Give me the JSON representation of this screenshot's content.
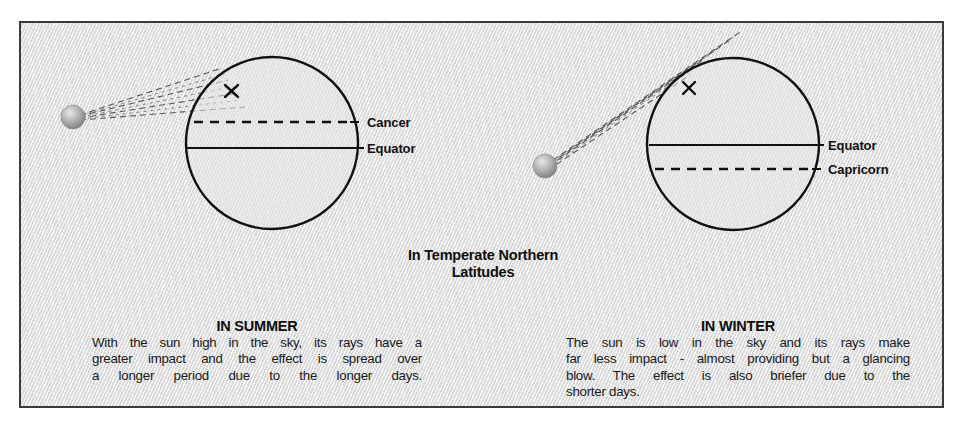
{
  "figure": {
    "background_color": "#ffffff",
    "panel_color": "#ececec",
    "border_color": "#3a3a3a",
    "ink_color": "#111111",
    "sun_color": "#9a9a9a"
  },
  "center_heading": {
    "line1": "In Temperate Northern",
    "line2": "Latitudes"
  },
  "summer": {
    "title": "IN SUMMER",
    "body": "With the sun high in the sky, its rays have a greater impact and the effect is spread over a longer period due to the longer days.",
    "lines": [
      "With the sun high in the sky, its rays have a",
      "greater impact and the effect is spread over",
      "a longer period due to the longer days."
    ],
    "diagram": {
      "sun_label": "sun",
      "marker": "x",
      "labels": {
        "upper": "Cancer",
        "lower": "Equator"
      },
      "upper_line_style": "dashed",
      "lower_line_style": "solid",
      "ray_count": 4
    }
  },
  "winter": {
    "title": "IN WINTER",
    "body": "The sun is low in the sky and its rays make far less impact - almost providing but a glancing blow. The effect is also briefer due to the shorter days.",
    "lines": [
      "The sun is low in the sky and its rays make",
      "far less impact - almost providing but a glancing",
      "blow. The effect is also briefer due to the",
      "shorter days."
    ],
    "diagram": {
      "sun_label": "sun",
      "marker": "x",
      "labels": {
        "upper": "Equator",
        "lower": "Capricorn"
      },
      "upper_line_style": "solid",
      "lower_line_style": "dashed",
      "ray_count": 4
    }
  }
}
